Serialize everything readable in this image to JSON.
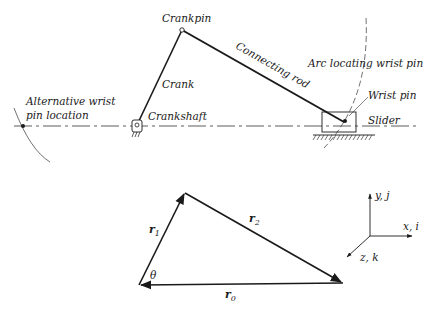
{
  "mechanism": {
    "labels": {
      "crankpin": "Crankpin",
      "crank": "Crank",
      "crankshaft": "Crankshaft",
      "connecting_rod": "Connecting rod",
      "arc_locating": "Arc locating wrist pin",
      "wrist_pin": "Wrist pin",
      "slider": "Slider",
      "alt_line1": "Alternative wrist",
      "alt_line2": "pin location"
    }
  },
  "vector_loop": {
    "r1": "r",
    "r1_sub": "1",
    "r2": "r",
    "r2_sub": "2",
    "r0": "r",
    "r0_sub": "0",
    "theta": "θ"
  },
  "axes": {
    "y": "y, j",
    "x": "x, i",
    "z": "z, k"
  },
  "colors": {
    "ink": "#1a1a1a",
    "background": "#ffffff"
  }
}
